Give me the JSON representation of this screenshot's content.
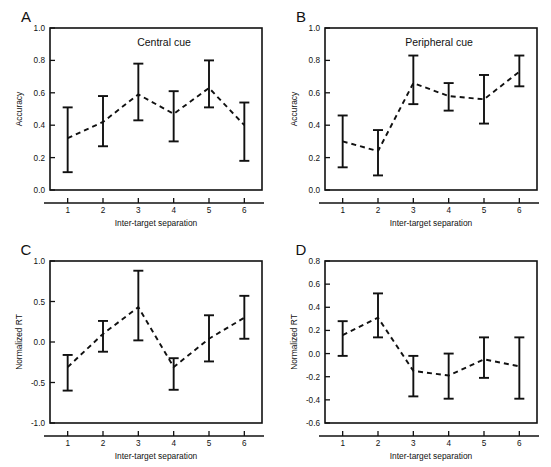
{
  "figure": {
    "background": "#ffffff",
    "ink_color": "#111111",
    "xlabel": "Inter-target separation",
    "x_categories": [
      "1",
      "2",
      "3",
      "4",
      "5",
      "6"
    ]
  },
  "chart_data": [
    {
      "panel": "A",
      "type": "line",
      "title": "Central cue",
      "xlabel": "Inter-target separation",
      "ylabel": "Accuracy",
      "categories": [
        "1",
        "2",
        "3",
        "4",
        "5",
        "6"
      ],
      "x": [
        1,
        2,
        3,
        4,
        5,
        6
      ],
      "values": [
        0.32,
        0.42,
        0.59,
        0.47,
        0.63,
        0.4
      ],
      "err_low": [
        0.11,
        0.27,
        0.43,
        0.3,
        0.51,
        0.18
      ],
      "err_high": [
        0.51,
        0.58,
        0.78,
        0.61,
        0.8,
        0.54
      ],
      "ylim": [
        0.0,
        1.0
      ],
      "yticks": [
        0.0,
        0.2,
        0.4,
        0.6,
        0.8,
        1.0
      ],
      "ytick_labels": [
        "0.0",
        "0.2",
        "0.4",
        "0.6",
        "0.8",
        "1.0"
      ],
      "grid": false,
      "legend": "none",
      "line_style": "dashed",
      "error_bars": true
    },
    {
      "panel": "B",
      "type": "line",
      "title": "Peripheral cue",
      "xlabel": "Inter-target separation",
      "ylabel": "Accuracy",
      "categories": [
        "1",
        "2",
        "3",
        "4",
        "5",
        "6"
      ],
      "x": [
        1,
        2,
        3,
        4,
        5,
        6
      ],
      "values": [
        0.3,
        0.24,
        0.66,
        0.58,
        0.56,
        0.73
      ],
      "err_low": [
        0.14,
        0.09,
        0.53,
        0.49,
        0.41,
        0.64
      ],
      "err_high": [
        0.46,
        0.37,
        0.83,
        0.66,
        0.71,
        0.83
      ],
      "ylim": [
        0.0,
        1.0
      ],
      "yticks": [
        0.0,
        0.2,
        0.4,
        0.6,
        0.8,
        1.0
      ],
      "ytick_labels": [
        "0.0",
        "0.2",
        "0.4",
        "0.6",
        "0.8",
        "1.0"
      ],
      "grid": false,
      "legend": "none",
      "line_style": "dashed",
      "error_bars": true
    },
    {
      "panel": "C",
      "type": "line",
      "title": "",
      "xlabel": "Inter-target separation",
      "ylabel": "Normalized RT",
      "categories": [
        "1",
        "2",
        "3",
        "4",
        "5",
        "6"
      ],
      "x": [
        1,
        2,
        3,
        4,
        5,
        6
      ],
      "values": [
        -0.31,
        0.1,
        0.43,
        -0.31,
        0.04,
        0.3
      ],
      "err_low": [
        -0.6,
        -0.12,
        0.02,
        -0.59,
        -0.24,
        0.04
      ],
      "err_high": [
        -0.16,
        0.26,
        0.88,
        -0.2,
        0.33,
        0.57
      ],
      "ylim": [
        -1.0,
        1.0
      ],
      "yticks": [
        -1.0,
        -0.5,
        0.0,
        0.5,
        1.0
      ],
      "ytick_labels": [
        "-1.0",
        "-0.5",
        "0.0",
        "0.5",
        "1.0"
      ],
      "grid": false,
      "legend": "none",
      "line_style": "dashed",
      "error_bars": true
    },
    {
      "panel": "D",
      "type": "line",
      "title": "",
      "xlabel": "Inter-target separation",
      "ylabel": "Normalized RT",
      "categories": [
        "1",
        "2",
        "3",
        "4",
        "5",
        "6"
      ],
      "x": [
        1,
        2,
        3,
        4,
        5,
        6
      ],
      "values": [
        0.16,
        0.31,
        -0.15,
        -0.19,
        -0.05,
        -0.11
      ],
      "err_low": [
        -0.02,
        0.14,
        -0.37,
        -0.39,
        -0.21,
        -0.39
      ],
      "err_high": [
        0.28,
        0.52,
        -0.02,
        0.0,
        0.14,
        0.14
      ],
      "ylim": [
        -0.6,
        0.8
      ],
      "yticks": [
        -0.6,
        -0.4,
        -0.2,
        0.0,
        0.2,
        0.4,
        0.6,
        0.8
      ],
      "ytick_labels": [
        "-0.6",
        "-0.4",
        "-0.2",
        "0.0",
        "0.2",
        "0.4",
        "0.6",
        "0.8"
      ],
      "grid": false,
      "legend": "none",
      "line_style": "dashed",
      "error_bars": true
    }
  ]
}
